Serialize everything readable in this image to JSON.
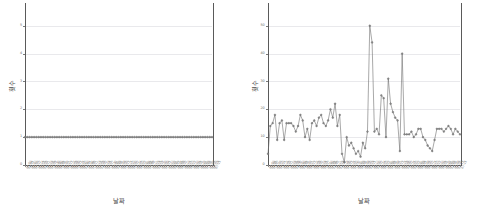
{
  "figure": {
    "background": "#ffffff",
    "line_color": "#6e6e6e",
    "marker_color": "#8c8c8c",
    "grid_color": "#e9e9ec",
    "axis_color": "#5a5a5a"
  },
  "panels": [
    {
      "id": "left",
      "axis_title_y": "횟수",
      "axis_title_x": "날짜"
    },
    {
      "id": "right",
      "axis_title_y": "횟수",
      "axis_title_x": "날짜"
    }
  ],
  "chart_data": [
    {
      "type": "line",
      "title": "",
      "xlabel": "날짜",
      "ylabel": "횟수",
      "ylim": [
        0,
        5.6
      ],
      "yticks": [
        0,
        1,
        2,
        3,
        4,
        5
      ],
      "ytick_labels": [
        "0",
        "1",
        "2",
        "3",
        "4",
        "5"
      ],
      "grid": true,
      "legend": "none",
      "markers": true,
      "x": [
        "01-02",
        "01-05",
        "01-07",
        "01-09",
        "01-12",
        "01-14",
        "01-16",
        "01-19",
        "01-21",
        "01-23",
        "01-26",
        "01-28",
        "01-30",
        "02-02",
        "02-04",
        "02-06",
        "02-09",
        "02-11",
        "02-13",
        "02-16",
        "02-18",
        "02-20",
        "02-23",
        "02-25",
        "02-27",
        "03-02",
        "03-04",
        "03-06",
        "03-09",
        "03-11",
        "03-13",
        "03-16",
        "03-18",
        "03-20",
        "03-23",
        "03-25",
        "03-27",
        "03-30",
        "04-01",
        "04-03",
        "04-06",
        "04-08",
        "04-10",
        "04-13",
        "04-15",
        "04-17",
        "04-20",
        "04-22",
        "04-24",
        "04-27",
        "04-29",
        "05-01",
        "05-04",
        "05-06",
        "05-08",
        "05-11",
        "05-13",
        "05-15",
        "05-18",
        "05-20",
        "05-22",
        "05-25",
        "05-27",
        "05-29",
        "06-01",
        "06-03",
        "06-05",
        "06-08",
        "06-10",
        "06-12",
        "06-15",
        "06-17",
        "06-19",
        "06-22",
        "06-24",
        "06-26",
        "06-29",
        "07-01",
        "07-03",
        "07-06",
        "07-08",
        "07-10",
        "07-13",
        "07-15"
      ],
      "values": [
        1,
        1,
        1,
        1,
        1,
        1,
        1,
        1,
        1,
        1,
        1,
        1,
        1,
        1,
        1,
        1,
        1,
        1,
        1,
        1,
        1,
        1,
        1,
        1,
        1,
        1,
        1,
        1,
        1,
        1,
        1,
        1,
        1,
        1,
        1,
        1,
        1,
        1,
        1,
        1,
        1,
        1,
        1,
        1,
        1,
        1,
        1,
        1,
        1,
        1,
        1,
        1,
        1,
        1,
        1,
        1,
        1,
        1,
        1,
        1,
        1,
        1,
        1,
        1,
        1,
        1,
        1,
        1,
        1,
        1,
        1,
        1,
        1,
        1,
        1,
        1,
        1,
        1,
        1,
        1,
        1,
        1,
        1
      ]
    },
    {
      "type": "line",
      "title": "",
      "xlabel": "날짜",
      "ylabel": "횟수",
      "ylim": [
        0,
        56
      ],
      "yticks": [
        0,
        10,
        20,
        30,
        40,
        50
      ],
      "ytick_labels": [
        "0",
        "10",
        "20",
        "30",
        "40",
        "50"
      ],
      "grid": true,
      "legend": "none",
      "markers": true,
      "x": [
        "01-02",
        "01-05",
        "01-07",
        "01-09",
        "01-12",
        "01-14",
        "01-16",
        "01-19",
        "01-21",
        "01-23",
        "01-26",
        "01-28",
        "01-30",
        "02-02",
        "02-04",
        "02-06",
        "02-09",
        "02-11",
        "02-13",
        "02-16",
        "02-18",
        "02-20",
        "02-23",
        "02-25",
        "02-27",
        "03-02",
        "03-04",
        "03-06",
        "03-09",
        "03-11",
        "03-13",
        "03-16",
        "03-18",
        "03-20",
        "03-23",
        "03-25",
        "03-27",
        "03-30",
        "04-01",
        "04-03",
        "04-06",
        "04-08",
        "04-10",
        "04-13",
        "04-15",
        "04-17",
        "04-20",
        "04-22",
        "04-24",
        "04-27",
        "04-29",
        "05-01",
        "05-04",
        "05-06",
        "05-08",
        "05-11",
        "05-13",
        "05-15",
        "05-18",
        "05-20",
        "05-22",
        "05-25",
        "05-27",
        "05-29",
        "06-01",
        "06-03",
        "06-05",
        "06-08",
        "06-10",
        "06-12",
        "06-15",
        "06-17",
        "06-19",
        "06-22",
        "06-24",
        "06-26",
        "06-29",
        "07-01",
        "07-03",
        "07-06",
        "07-08",
        "07-10",
        "07-13",
        "07-15"
      ],
      "values": [
        4,
        14,
        15,
        18,
        9,
        15,
        16,
        9,
        15,
        15,
        15,
        14,
        12,
        14,
        18,
        16,
        10,
        13,
        9,
        15,
        16,
        14,
        17,
        18,
        15,
        14,
        16,
        20,
        17,
        22,
        14,
        18,
        4,
        1,
        10,
        7,
        8,
        6,
        4,
        5,
        3,
        8,
        6,
        12,
        50,
        44,
        12,
        13,
        11,
        25,
        24,
        10,
        31,
        22,
        19,
        17,
        16,
        5,
        40,
        11,
        11,
        11,
        12,
        10,
        11,
        13,
        13,
        10,
        9,
        7,
        6,
        5,
        9,
        13,
        13,
        13,
        12,
        13,
        14,
        13,
        11,
        13,
        12,
        11
      ]
    }
  ]
}
